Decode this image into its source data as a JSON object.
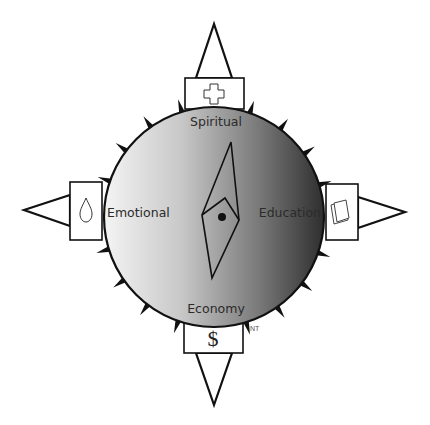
{
  "diagram": {
    "directions": {
      "north": {
        "label": "Spiritual",
        "icon": "cross-icon"
      },
      "south": {
        "label": "Economy",
        "icon": "dollar-icon",
        "glyph": "$"
      },
      "west": {
        "label": "Emotional",
        "icon": "drop-icon"
      },
      "east": {
        "label": "Education",
        "icon": "book-icon"
      }
    },
    "annotation": "NT",
    "colors": {
      "dial_light": "#f4f4f4",
      "dial_dark": "#2e2e2e",
      "stroke": "#111111",
      "background": "#ffffff"
    },
    "spikes_per_quadrant": 4
  }
}
